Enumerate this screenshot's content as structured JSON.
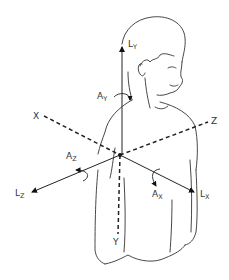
{
  "diagram": {
    "title": "",
    "axes": {
      "x": {
        "label": "X"
      },
      "y": {
        "label": "Y"
      },
      "z": {
        "label": "Z"
      }
    },
    "linear_vectors": {
      "ly": {
        "base": "L",
        "sub": "Y"
      },
      "lx": {
        "base": "L",
        "sub": "X"
      },
      "lz": {
        "base": "L",
        "sub": "Z"
      }
    },
    "angular_vectors": {
      "ay": {
        "base": "A",
        "sub": "Y"
      },
      "ax": {
        "base": "A",
        "sub": "X"
      },
      "az": {
        "base": "A",
        "sub": "Z"
      }
    }
  }
}
